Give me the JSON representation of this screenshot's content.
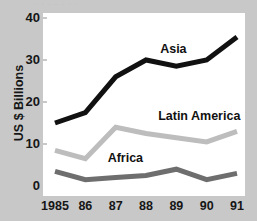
{
  "chart_data": {
    "type": "line",
    "title": "",
    "subtitle": "",
    "xlabel": "",
    "ylabel": "US $ Billions",
    "categories": [
      "1985",
      "86",
      "87",
      "88",
      "89",
      "90",
      "91"
    ],
    "x_tick_labels": [
      "1985",
      "86",
      "87",
      "88",
      "89",
      "90",
      "91"
    ],
    "y_tick_labels": [
      "0",
      "10",
      "20",
      "30",
      "40"
    ],
    "y_tick_values": [
      0,
      10,
      20,
      30,
      40
    ],
    "ylim": [
      0,
      40
    ],
    "grid": false,
    "legend_position": "inline-on-lines",
    "series": [
      {
        "name": "Asia",
        "color": "#111111",
        "line_width": 5,
        "values": [
          15,
          17.5,
          26,
          30,
          28.5,
          30,
          35.5
        ]
      },
      {
        "name": "Latin America",
        "color": "#bdbdbd",
        "line_width": 5,
        "values": [
          8.5,
          6.5,
          14,
          12.5,
          11.5,
          10.5,
          13
        ]
      },
      {
        "name": "Africa",
        "color": "#6e6e6e",
        "line_width": 5,
        "values": [
          3.5,
          1.5,
          2,
          2.5,
          4,
          1.5,
          3
        ]
      }
    ],
    "annotations": [
      {
        "text": "Asia",
        "x_pct": 58,
        "y_value": 32.5
      },
      {
        "text": "Latin America",
        "x_pct": 57,
        "y_value": 16.5
      },
      {
        "text": "Africa",
        "x_pct": 32,
        "y_value": 6.5
      }
    ]
  },
  "figure": {
    "background_color": "#c8c8c8",
    "plot_background_color": "#ffffff",
    "axis_text_color": "#161616",
    "top_bleed_text": "·  ·    ·  ·      ·    ·  ·"
  }
}
